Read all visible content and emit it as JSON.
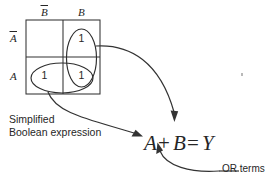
{
  "diagram": {
    "colors": {
      "stroke": "#333333",
      "text": "#262626",
      "background": "#ffffff"
    }
  },
  "kmap": {
    "column_headers": [
      {
        "text": "B",
        "overbar": true,
        "name": "not-b"
      },
      {
        "text": "B",
        "overbar": false,
        "name": "b"
      }
    ],
    "row_headers": [
      {
        "text": "A",
        "overbar": true,
        "name": "not-a"
      },
      {
        "text": "A",
        "overbar": false,
        "name": "a"
      }
    ],
    "cells": [
      {
        "row": 0,
        "col": 0,
        "value": ""
      },
      {
        "row": 0,
        "col": 1,
        "value": "1"
      },
      {
        "row": 1,
        "col": 0,
        "value": "1"
      },
      {
        "row": 1,
        "col": 1,
        "value": "1"
      }
    ],
    "groupings": [
      {
        "name": "b-column-group",
        "term": "B",
        "orientation": "vertical"
      },
      {
        "name": "a-row-group",
        "term": "A",
        "orientation": "horizontal"
      }
    ]
  },
  "annotations": {
    "simplified_line1": "Simplified",
    "simplified_line2": "Boolean expression",
    "or_terms": "OR terms"
  },
  "expression": {
    "operand_a": "A",
    "operator_or": "+",
    "operand_b": "B",
    "operator_eq": "=",
    "result": "Y",
    "full": "A + B = Y"
  }
}
